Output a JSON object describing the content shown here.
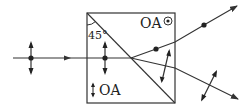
{
  "diagram": {
    "type": "optics",
    "labels": {
      "optic_axis_top": "OA",
      "optic_axis_top_symbol": "⊙",
      "optic_axis_bottom": "OA",
      "optic_axis_bottom_symbol": "↕",
      "angle": "45°"
    },
    "colors": {
      "stroke": "#333333",
      "background": "#ffffff"
    },
    "elements": {
      "prism_box": {
        "x": 87,
        "y": 13,
        "width": 88,
        "height": 90
      },
      "interface_diagonal": {
        "from": [
          87,
          13
        ],
        "to": [
          175,
          103
        ]
      },
      "incident_ray": {
        "from": [
          13,
          58
        ],
        "to": [
          131,
          58
        ]
      },
      "ray_upper": {
        "points": [
          [
            131,
            58
          ],
          [
            175,
            42
          ],
          [
            237,
            6
          ]
        ],
        "polarization": "perpendicular-to-page (dot)"
      },
      "ray_lower": {
        "points": [
          [
            131,
            58
          ],
          [
            175,
            68
          ],
          [
            238,
            99
          ]
        ],
        "polarization": "in-plane (double arrow)"
      }
    }
  }
}
